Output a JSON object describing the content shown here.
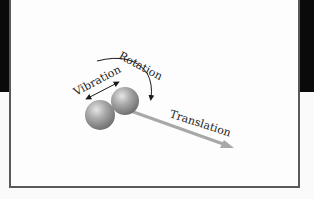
{
  "diagram": {
    "labels": {
      "rotation": "Rotation",
      "vibration": "Vibration",
      "translation": "Translation"
    },
    "colors": {
      "frame": "#5a5a5a",
      "band": "#0a0a0a",
      "sphere": "#9a9a9a",
      "translation_arrow": "#a8a8a8",
      "arrow_lines": "#1a1a1a"
    }
  }
}
